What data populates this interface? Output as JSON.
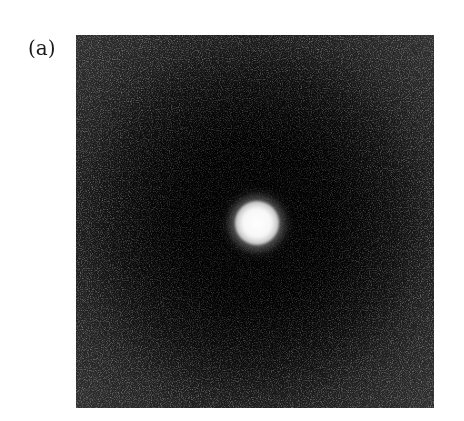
{
  "figure": {
    "panel_label": "(a)",
    "colors": {
      "background": "#ffffff",
      "image_dark": "#040404",
      "image_edge": "#303030",
      "spot": "#ffffff"
    }
  }
}
